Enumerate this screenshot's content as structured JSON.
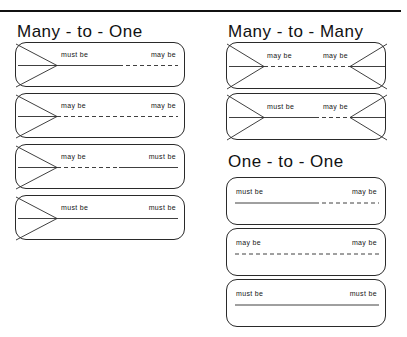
{
  "page": {
    "width": 407,
    "height": 337,
    "background": "#ffffff",
    "ink": "#111111",
    "top_rule": {
      "visible": true
    }
  },
  "sections": [
    {
      "id": "many-to-one",
      "title": "Many  -  to  -  One",
      "left_end": "crowsfoot",
      "right_end": "single",
      "relations": [
        {
          "left_label": "must be",
          "right_label": "may be",
          "left_style": "solid",
          "right_style": "dashed"
        },
        {
          "left_label": "may be",
          "right_label": "may be",
          "left_style": "dashed",
          "right_style": "dashed"
        },
        {
          "left_label": "may be",
          "right_label": "must be",
          "left_style": "dashed",
          "right_style": "solid"
        },
        {
          "left_label": "must be",
          "right_label": "must be",
          "left_style": "solid",
          "right_style": "solid"
        }
      ]
    },
    {
      "id": "many-to-many",
      "title": "Many  -  to  -  Many",
      "left_end": "crowsfoot",
      "right_end": "crowsfoot",
      "relations": [
        {
          "left_label": "may be",
          "right_label": "may be",
          "left_style": "dashed",
          "right_style": "dashed"
        },
        {
          "left_label": "must be",
          "right_label": "may be",
          "left_style": "solid",
          "right_style": "dashed"
        }
      ]
    },
    {
      "id": "one-to-one",
      "title": "One  -  to  -  One",
      "left_end": "single",
      "right_end": "single",
      "relations": [
        {
          "left_label": "must be",
          "right_label": "may be",
          "left_style": "solid",
          "right_style": "dashed"
        },
        {
          "left_label": "may be",
          "right_label": "may be",
          "left_style": "dashed",
          "right_style": "dashed"
        },
        {
          "left_label": "must be",
          "right_label": "must be",
          "left_style": "solid",
          "right_style": "solid"
        }
      ]
    }
  ]
}
